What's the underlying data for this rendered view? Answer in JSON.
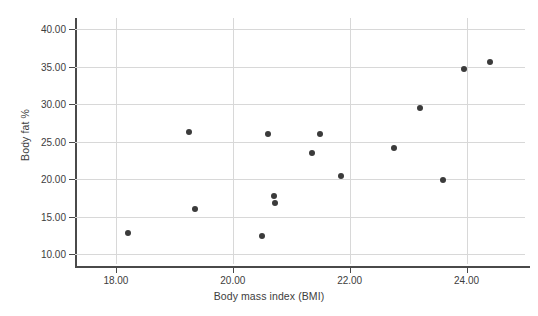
{
  "chart_data": {
    "type": "scatter",
    "title": "",
    "xlabel": "Body mass index (BMI)",
    "ylabel": "Body fat %",
    "xlim": [
      17.3,
      25.0
    ],
    "ylim": [
      8.7,
      41.5
    ],
    "grid": true,
    "legend": null,
    "xticks": [
      "18.00",
      "20.00",
      "22.00",
      "24.00"
    ],
    "xtick_values": [
      18.0,
      20.0,
      22.0,
      24.0
    ],
    "yticks": [
      "10.00",
      "15.00",
      "20.00",
      "25.00",
      "30.00",
      "35.00",
      "40.00"
    ],
    "ytick_values": [
      10.0,
      15.0,
      20.0,
      25.0,
      30.0,
      35.0,
      40.0
    ],
    "marker_color": "#3b3b3b",
    "grid_color": "#d8d8d8",
    "axis_color": "#4a4a4a",
    "points": [
      {
        "x": 18.2,
        "y": 12.8
      },
      {
        "x": 19.25,
        "y": 26.3
      },
      {
        "x": 19.35,
        "y": 16.1
      },
      {
        "x": 20.5,
        "y": 12.5
      },
      {
        "x": 20.6,
        "y": 26.1
      },
      {
        "x": 20.7,
        "y": 17.8
      },
      {
        "x": 20.72,
        "y": 16.9
      },
      {
        "x": 21.35,
        "y": 23.5
      },
      {
        "x": 21.5,
        "y": 26.0
      },
      {
        "x": 21.85,
        "y": 20.5
      },
      {
        "x": 22.75,
        "y": 24.2
      },
      {
        "x": 23.2,
        "y": 29.5
      },
      {
        "x": 23.6,
        "y": 19.9
      },
      {
        "x": 23.95,
        "y": 34.7
      },
      {
        "x": 24.4,
        "y": 35.7
      }
    ]
  }
}
